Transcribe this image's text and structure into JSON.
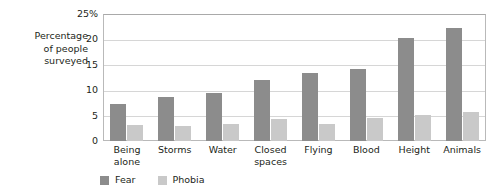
{
  "chart_data": {
    "type": "bar",
    "title": "",
    "subtitle": "",
    "xlabel": "",
    "ylabel": "Percentage\nof people\nsurveyed",
    "ylim": [
      0,
      25
    ],
    "yticks": [
      0,
      5,
      10,
      15,
      20,
      25
    ],
    "ytick_labels": [
      "0",
      "5",
      "10",
      "15",
      "20",
      "25%"
    ],
    "grid": true,
    "legend_position": "bottom-left",
    "categories": [
      "Being\nalone",
      "Storms",
      "Water",
      "Closed\nspaces",
      "Flying",
      "Blood",
      "Height",
      "Animals"
    ],
    "series": [
      {
        "name": "Fear",
        "color": "#8c8c8c",
        "values": [
          7.2,
          8.6,
          9.5,
          12.0,
          13.4,
          14.1,
          20.3,
          22.2
        ]
      },
      {
        "name": "Phobia",
        "color": "#c9c9c9",
        "values": [
          3.1,
          3.0,
          3.4,
          4.3,
          3.4,
          4.5,
          5.2,
          5.7
        ]
      }
    ]
  }
}
